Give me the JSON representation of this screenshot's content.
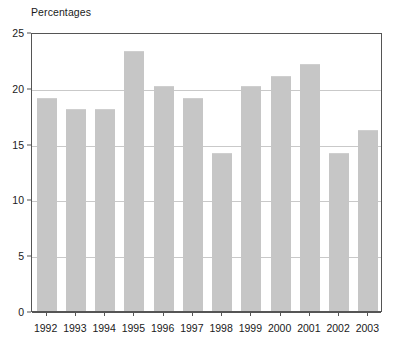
{
  "chart_data": {
    "type": "bar",
    "title": "Percentages",
    "xlabel": "",
    "ylabel": "",
    "ylim": [
      0,
      25
    ],
    "yticks": [
      0,
      5,
      10,
      15,
      20,
      25
    ],
    "grid": true,
    "legend": false,
    "bar_color": "#c6c6c6",
    "categories": [
      "1992",
      "1993",
      "1994",
      "1995",
      "1996",
      "1997",
      "1998",
      "1999",
      "2000",
      "2001",
      "2002",
      "2003"
    ],
    "values": [
      19.1,
      18.1,
      18.1,
      23.3,
      20.2,
      19.1,
      14.2,
      20.2,
      21.1,
      22.1,
      14.2,
      16.2
    ]
  }
}
